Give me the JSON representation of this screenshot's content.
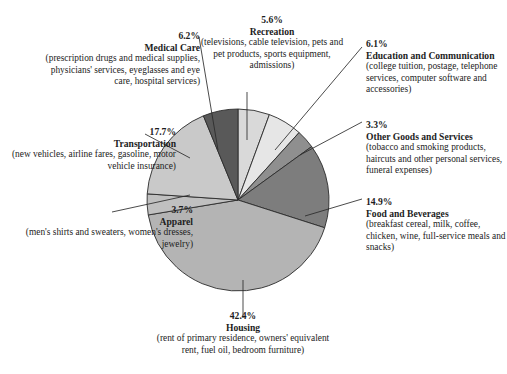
{
  "chart_data": {
    "type": "pie",
    "title": "",
    "units": "percent of consumer expenditures",
    "legend_position": "callout-labels",
    "start_angle_deg": -90,
    "direction": "clockwise",
    "categories": [
      "Recreation",
      "Education and Communication",
      "Other Goods and Services",
      "Food and Beverages",
      "Housing",
      "Apparel",
      "Transportation",
      "Medical Care"
    ],
    "values": [
      5.6,
      6.1,
      3.3,
      14.9,
      42.4,
      3.7,
      17.7,
      6.2
    ],
    "colors": [
      "#d9d9d9",
      "#e6e6e6",
      "#8f8f8f",
      "#7d7d7d",
      "#b4b4b4",
      "#c0c0c0",
      "#c9c9c9",
      "#595959"
    ],
    "slices": [
      {
        "label": "Recreation",
        "percent": "5.6%",
        "value": 5.6,
        "color": "#d9d9d9",
        "detail": "(televisions, cable television, pets and pet products, sports equipment, admissions)"
      },
      {
        "label": "Education and Communication",
        "percent": "6.1%",
        "value": 6.1,
        "color": "#e6e6e6",
        "detail": "(college tuition, postage, telephone services, computer software and accessories)"
      },
      {
        "label": "Other Goods and Services",
        "percent": "3.3%",
        "value": 3.3,
        "color": "#8f8f8f",
        "detail": "(tobacco and smoking products, haircuts and other personal services, funeral expenses)"
      },
      {
        "label": "Food and Beverages",
        "percent": "14.9%",
        "value": 14.9,
        "color": "#7d7d7d",
        "detail": "(breakfast cereal, milk, coffee, chicken, wine, full-service meals and snacks)"
      },
      {
        "label": "Housing",
        "percent": "42.4%",
        "value": 42.4,
        "color": "#b4b4b4",
        "detail": "(rent of primary residence, owners' equivalent rent, fuel oil, bedroom furniture)"
      },
      {
        "label": "Apparel",
        "percent": "3.7%",
        "value": 3.7,
        "color": "#c0c0c0",
        "detail": "(men's shirts and sweaters, women's dresses, jewelry)"
      },
      {
        "label": "Transportation",
        "percent": "17.7%",
        "value": 17.7,
        "color": "#c9c9c9",
        "detail": "(new vehicles, airline fares, gasoline, motor vehicle insurance)"
      },
      {
        "label": "Medical Care",
        "percent": "6.2%",
        "value": 6.2,
        "color": "#595959",
        "detail": "(prescription drugs and medical supplies, physicians' services, eyeglasses and eye care, hospital services)"
      }
    ]
  },
  "labels": {
    "medical": {
      "percent": "6.2%",
      "name": "Medical Care",
      "detail": "(prescription drugs and medical supplies, physicians' services, eyeglasses and eye care, hospital services)"
    },
    "recreation": {
      "percent": "5.6%",
      "name": "Recreation",
      "detail": "(televisions, cable television, pets and pet products, sports equipment, admissions)"
    },
    "education": {
      "percent": "6.1%",
      "name": "Education and Communication",
      "detail": "(college tuition, postage, telephone services, computer software and accessories)"
    },
    "other_goods": {
      "percent": "3.3%",
      "name": "Other Goods and Services",
      "detail": "(tobacco and smoking products, haircuts and other personal services, funeral expenses)"
    },
    "food": {
      "percent": "14.9%",
      "name": "Food and Beverages",
      "detail": "(breakfast cereal, milk, coffee, chicken, wine, full-service meals and snacks)"
    },
    "housing": {
      "percent": "42.4%",
      "name": "Housing",
      "detail": "(rent of primary residence, owners' equivalent rent, fuel oil, bedroom furniture)"
    },
    "apparel": {
      "percent": "3.7%",
      "name": "Apparel",
      "detail": "(men's shirts and sweaters, women's dresses, jewelry)"
    },
    "transportation": {
      "percent": "17.7%",
      "name": "Transportation",
      "detail": "(new vehicles, airline fares, gasoline, motor vehicle insurance)"
    }
  }
}
